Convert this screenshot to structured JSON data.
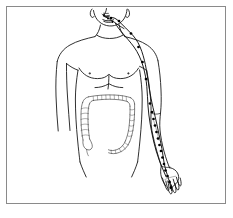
{
  "figure": {
    "caption": "",
    "frame": {
      "border_color": "#8a8a8a",
      "background": "#ffffff",
      "x": 6,
      "y": 6,
      "width": 220,
      "height": 198
    },
    "ink_color": "#1a1a1a",
    "organ_color": "#2b2b2b",
    "meridian_color": "#111111",
    "point_color": "#000000"
  },
  "regions": {
    "head": "head-and-jaw",
    "neck": "neck",
    "chest": "chest-and-shoulders",
    "abdomen": "abdomen",
    "left_arm": "left-arm-extended",
    "right_arm": "right-arm-partial",
    "hand": "left-hand"
  },
  "organ": {
    "name": "large-intestine",
    "label": "Large Intestine (Colon)",
    "segments": [
      "ascending-colon",
      "transverse-colon",
      "descending-colon",
      "sigmoid-colon"
    ],
    "style": "stippled-haustra-outline"
  },
  "meridian": {
    "name": "large-intestine-meridian",
    "label": "Large Intestine Meridian (LI)",
    "side": "left",
    "path_description": "from index finger up the radial forearm, across the elbow, along the lateral upper arm, over the shoulder, up the side of the neck to the face beside the nose",
    "branch_count": 2,
    "point_count": 20,
    "points": [
      {
        "id": "LI1",
        "x": 171.0,
        "y": 187.5
      },
      {
        "id": "LI2",
        "x": 169.5,
        "y": 182.0
      },
      {
        "id": "LI3",
        "x": 167.5,
        "y": 176.0
      },
      {
        "id": "LI4",
        "x": 165.5,
        "y": 170.5
      },
      {
        "id": "LI5",
        "x": 164.0,
        "y": 164.0
      },
      {
        "id": "LI6",
        "x": 162.5,
        "y": 157.5
      },
      {
        "id": "LI7",
        "x": 161.0,
        "y": 151.0
      },
      {
        "id": "LI8",
        "x": 159.5,
        "y": 145.0
      },
      {
        "id": "LI9",
        "x": 158.0,
        "y": 138.5
      },
      {
        "id": "LI10",
        "x": 156.5,
        "y": 132.0
      },
      {
        "id": "LI11",
        "x": 155.0,
        "y": 125.5
      },
      {
        "id": "LI12",
        "x": 153.5,
        "y": 119.0
      },
      {
        "id": "LI13",
        "x": 152.0,
        "y": 112.0
      },
      {
        "id": "LI14",
        "x": 150.0,
        "y": 103.5
      },
      {
        "id": "LI15",
        "x": 146.0,
        "y": 79.0
      },
      {
        "id": "LI16",
        "x": 142.5,
        "y": 62.0
      },
      {
        "id": "LI17",
        "x": 138.5,
        "y": 47.0
      },
      {
        "id": "LI18",
        "x": 131.0,
        "y": 33.5
      },
      {
        "id": "LI19",
        "x": 119.0,
        "y": 21.0
      },
      {
        "id": "LI20",
        "x": 111.0,
        "y": 18.0
      }
    ]
  },
  "face_points": [
    {
      "id": "face-1",
      "x": 104.0,
      "y": 15.0
    },
    {
      "id": "face-2",
      "x": 108.0,
      "y": 18.5
    },
    {
      "id": "face-3",
      "x": 112.5,
      "y": 22.0
    }
  ]
}
